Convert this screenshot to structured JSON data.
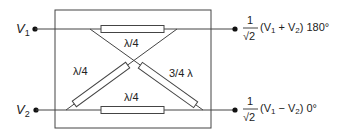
{
  "diagram": {
    "type": "hybrid coupler schematic",
    "inputs": {
      "v1": {
        "label": "V",
        "sub": "1"
      },
      "v2": {
        "label": "V",
        "sub": "2"
      }
    },
    "elements": {
      "top": {
        "label": "λ/4"
      },
      "bottom": {
        "label": "λ/4"
      },
      "diag_left": {
        "label": "λ/4"
      },
      "diag_right": {
        "label": "3/4 λ"
      }
    },
    "outputs": {
      "top": {
        "numerator": "1",
        "denominator": "√2",
        "expr_open": "(V",
        "sub_a": "1",
        "op": " + V",
        "sub_b": "2",
        "expr_close": ") 180°"
      },
      "bottom": {
        "numerator": "1",
        "denominator": "√2",
        "expr_open": "(V",
        "sub_a": "1",
        "op": " − V",
        "sub_b": "2",
        "expr_close": ") 0°"
      }
    },
    "colors": {
      "line": "#444444",
      "text": "#222222",
      "background": "#ffffff"
    }
  }
}
